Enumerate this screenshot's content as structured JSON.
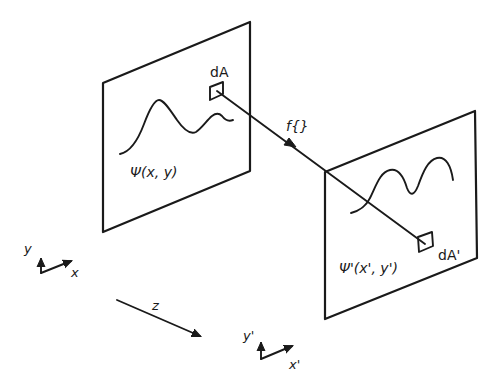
{
  "diagram": {
    "type": "optical-propagation-schematic",
    "colors": {
      "ink": "#1a1a1a",
      "background": "#ffffff"
    },
    "input_plane": {
      "field_label": "Ψ(x, y)",
      "area_element_label": "dA"
    },
    "output_plane": {
      "field_label": "Ψ'(x', y')",
      "area_element_label": "dA'"
    },
    "mapping": {
      "label": "f{}"
    },
    "input_axes": {
      "y_label": "y",
      "x_label": "x"
    },
    "output_axes": {
      "y_label": "y'",
      "x_label": "x'"
    },
    "propagation_axis": {
      "label": "z"
    }
  }
}
